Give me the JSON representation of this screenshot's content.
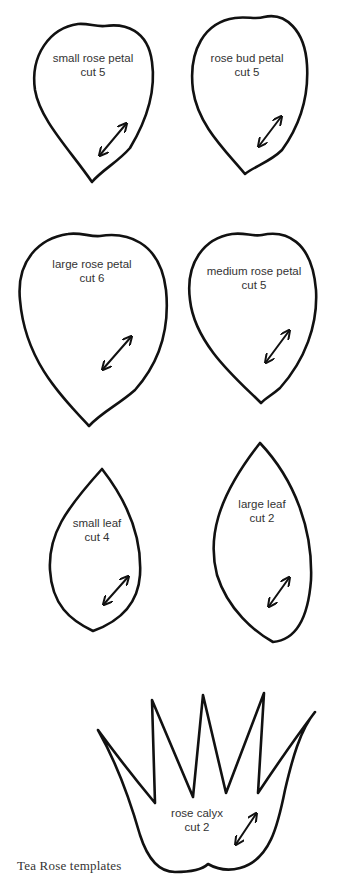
{
  "caption": "Tea Rose templates",
  "templates": [
    {
      "name": "small rose petal",
      "cut": "cut 5"
    },
    {
      "name": "rose bud petal",
      "cut": "cut 5"
    },
    {
      "name": "large rose petal",
      "cut": "cut 6"
    },
    {
      "name": "medium rose petal",
      "cut": "cut 5"
    },
    {
      "name": "small leaf",
      "cut": "cut 4"
    },
    {
      "name": "large leaf",
      "cut": "cut 2"
    },
    {
      "name": "rose calyx",
      "cut": "cut 2"
    }
  ],
  "colors": {
    "outline": "#111111",
    "text": "#333333",
    "background": "#ffffff"
  }
}
